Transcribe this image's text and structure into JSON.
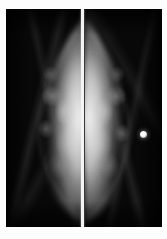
{
  "figure": {
    "caption": "",
    "modality": "mammogram",
    "view_description": "Bilateral mammogram pair displayed back-to-back in mirror image",
    "panel_count": 2
  },
  "plate": {
    "background_color": "#060606",
    "border_color": "#ffffff"
  },
  "panels": [
    {
      "id": "left",
      "data_name": "mammogram-panel-left",
      "laterality_label": "",
      "breast_orientation": "chest-wall-right",
      "annotation": "",
      "findings": []
    },
    {
      "id": "right",
      "data_name": "mammogram-panel-right",
      "laterality_label": "",
      "breast_orientation": "chest-wall-left",
      "annotation": "",
      "findings": [
        {
          "name": "radiopaque-marker",
          "label": "",
          "x_px": 143,
          "y_px": 134,
          "diameter_px": 7,
          "color": "#ffffff"
        }
      ]
    }
  ],
  "divider": {
    "name": "panel-divider",
    "color": "#f4f4f4",
    "x_px": 82,
    "width_px": 3
  },
  "annotations": {
    "top_left": "",
    "top_right": ""
  },
  "colors": {
    "film_black": "#060606",
    "tissue_bright": "#ebebeb",
    "marker_white": "#ffffff",
    "page_background": "#ffffff"
  }
}
